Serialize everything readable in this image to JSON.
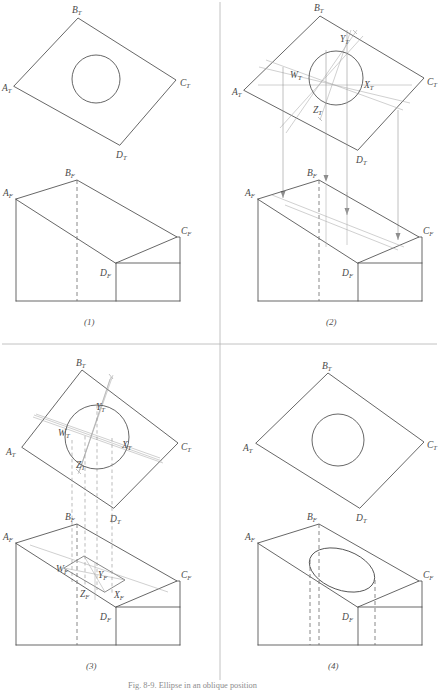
{
  "figure": {
    "caption": "Fig. 8-9.  Ellipse in an oblique position",
    "background_color": "#ffffff",
    "line_color": "#4b4b4b",
    "construction_color": "#a9a9a9"
  },
  "panels": [
    {
      "id": "panel-1",
      "step_label": "(1)",
      "description": "Top view shows true-size circle on oblique face; front view of the wedge block",
      "top_view": {
        "name": "top-view",
        "corner_labels": [
          {
            "base": "A",
            "sub": "T"
          },
          {
            "base": "B",
            "sub": "T"
          },
          {
            "base": "C",
            "sub": "T"
          },
          {
            "base": "D",
            "sub": "T"
          }
        ],
        "has_circle": true,
        "has_construction": false,
        "point_labels": []
      },
      "front_view": {
        "name": "front-view",
        "corner_labels": [
          {
            "base": "A",
            "sub": "F"
          },
          {
            "base": "B",
            "sub": "F"
          },
          {
            "base": "C",
            "sub": "F"
          },
          {
            "base": "D",
            "sub": "F"
          }
        ],
        "has_ellipse": false,
        "has_construction": false,
        "point_labels": []
      },
      "projectors": false
    },
    {
      "id": "panel-2",
      "step_label": "(2)",
      "description": "Enclosing square and axes W-X and Y-Z located in the top view, then projected down",
      "top_view": {
        "name": "top-view",
        "corner_labels": [
          {
            "base": "A",
            "sub": "T"
          },
          {
            "base": "B",
            "sub": "T"
          },
          {
            "base": "C",
            "sub": "T"
          },
          {
            "base": "D",
            "sub": "T"
          }
        ],
        "has_circle": true,
        "has_construction": true,
        "point_labels": [
          {
            "base": "W",
            "sub": "T"
          },
          {
            "base": "X",
            "sub": "T"
          },
          {
            "base": "Y",
            "sub": "T"
          },
          {
            "base": "Z",
            "sub": "T"
          }
        ]
      },
      "front_view": {
        "name": "front-view",
        "corner_labels": [
          {
            "base": "A",
            "sub": "F"
          },
          {
            "base": "B",
            "sub": "F"
          },
          {
            "base": "C",
            "sub": "F"
          },
          {
            "base": "D",
            "sub": "F"
          }
        ],
        "has_ellipse": false,
        "has_construction": true,
        "point_labels": []
      },
      "projectors": true,
      "projector_style": "arrow"
    },
    {
      "id": "panel-3",
      "step_label": "(3)",
      "description": "Points projected down give the enclosing parallelogram and conjugate axes in the front view",
      "top_view": {
        "name": "top-view",
        "corner_labels": [
          {
            "base": "A",
            "sub": "T"
          },
          {
            "base": "B",
            "sub": "T"
          },
          {
            "base": "C",
            "sub": "T"
          },
          {
            "base": "D",
            "sub": "T"
          }
        ],
        "has_circle": true,
        "has_construction": true,
        "point_labels": [
          {
            "base": "W",
            "sub": "T"
          },
          {
            "base": "X",
            "sub": "T"
          },
          {
            "base": "Y",
            "sub": "T"
          },
          {
            "base": "Z",
            "sub": "T"
          }
        ]
      },
      "front_view": {
        "name": "front-view",
        "corner_labels": [
          {
            "base": "A",
            "sub": "F"
          },
          {
            "base": "B",
            "sub": "F"
          },
          {
            "base": "C",
            "sub": "F"
          },
          {
            "base": "D",
            "sub": "F"
          }
        ],
        "has_ellipse": false,
        "has_construction": true,
        "point_labels": [
          {
            "base": "W",
            "sub": "F"
          },
          {
            "base": "X",
            "sub": "F"
          },
          {
            "base": "Y",
            "sub": "F"
          },
          {
            "base": "Z",
            "sub": "F"
          }
        ]
      },
      "projectors": true,
      "projector_style": "dashed"
    },
    {
      "id": "panel-4",
      "step_label": "(4)",
      "description": "Finished views: circle in the top view, ellipse inscribed in the parallelogram in the front view",
      "top_view": {
        "name": "top-view",
        "corner_labels": [
          {
            "base": "A",
            "sub": "T"
          },
          {
            "base": "B",
            "sub": "T"
          },
          {
            "base": "C",
            "sub": "T"
          },
          {
            "base": "D",
            "sub": "T"
          }
        ],
        "has_circle": true,
        "has_construction": false,
        "point_labels": []
      },
      "front_view": {
        "name": "front-view",
        "corner_labels": [
          {
            "base": "A",
            "sub": "F"
          },
          {
            "base": "B",
            "sub": "F"
          },
          {
            "base": "C",
            "sub": "F"
          },
          {
            "base": "D",
            "sub": "F"
          }
        ],
        "has_ellipse": true,
        "has_construction": false,
        "point_labels": []
      },
      "projectors": false
    }
  ]
}
